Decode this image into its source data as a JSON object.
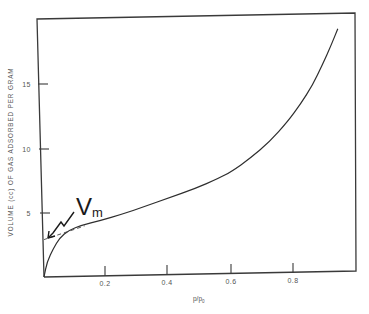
{
  "chart_data": {
    "type": "line",
    "title": "",
    "xlabel": "p/p0",
    "ylabel": "VOLUME (cc) OF GAS ADSORBED PER GRAM",
    "xlim": [
      0,
      1.0
    ],
    "ylim": [
      0,
      20
    ],
    "grid": false,
    "legend": null,
    "x_ticks": [
      0.2,
      0.4,
      0.6,
      0.8
    ],
    "x_tick_labels": [
      "0.2",
      "0.4",
      "0.6",
      "0.8"
    ],
    "y_ticks": [
      5,
      10,
      15
    ],
    "y_tick_labels": [
      "5",
      "10",
      "15"
    ],
    "series": [
      {
        "name": "adsorption isotherm",
        "style": "solid",
        "x": [
          0.0,
          0.01,
          0.03,
          0.05,
          0.08,
          0.12,
          0.18,
          0.25,
          0.32,
          0.4,
          0.48,
          0.56,
          0.6,
          0.66,
          0.72,
          0.78,
          0.82,
          0.86,
          0.89,
          0.92,
          0.94
        ],
        "y": [
          0.0,
          1.2,
          2.2,
          3.0,
          3.6,
          3.95,
          4.3,
          4.75,
          5.3,
          5.95,
          6.6,
          7.4,
          7.9,
          8.9,
          10.1,
          11.7,
          13.0,
          14.5,
          16.0,
          17.6,
          18.8
        ]
      },
      {
        "name": "linear extrapolation to Vm",
        "style": "dashed",
        "x": [
          0.0,
          0.13
        ],
        "y": [
          2.9,
          3.9
        ]
      }
    ],
    "annotations": [
      {
        "text": "V",
        "subscript": "m",
        "x": 0.07,
        "y": 6.2,
        "arrow_to": {
          "x": 0.005,
          "y": 3.0
        }
      }
    ]
  }
}
